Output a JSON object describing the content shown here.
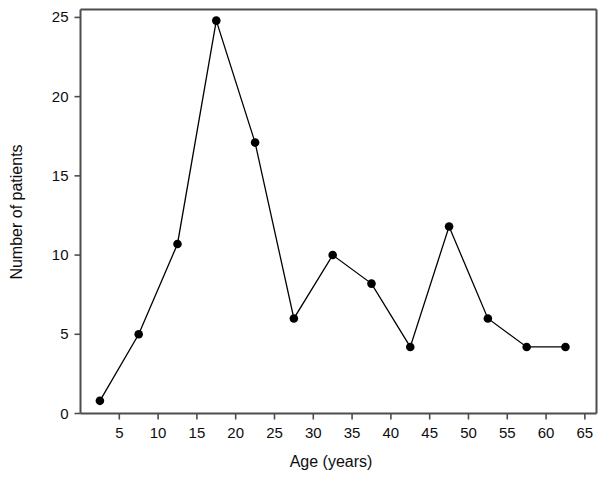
{
  "chart_data": {
    "type": "line",
    "title": "",
    "subtitle": "",
    "xlabel": "Age (years)",
    "ylabel": "Number of patients",
    "xlim": [
      0,
      66.5
    ],
    "ylim": [
      0,
      25.5
    ],
    "xticks": [
      5,
      10,
      15,
      20,
      25,
      30,
      35,
      40,
      45,
      50,
      55,
      60,
      65
    ],
    "yticks": [
      0,
      5,
      10,
      15,
      20,
      25
    ],
    "xtick_labels": [
      "5",
      "10",
      "15",
      "20",
      "25",
      "30",
      "35",
      "40",
      "45",
      "50",
      "55",
      "60",
      "65"
    ],
    "ytick_labels": [
      "0",
      "5",
      "10",
      "15",
      "20",
      "25"
    ],
    "grid": false,
    "legend": null,
    "legend_position": "none",
    "marker": "filled-circle",
    "marker_color": "#000000",
    "line_color": "#000000",
    "frame_color": "#4d4d4d",
    "background_color": "#ffffff",
    "x": [
      2.5,
      7.5,
      12.5,
      17.5,
      22.5,
      27.5,
      32.5,
      37.5,
      42.5,
      47.5,
      52.5,
      57.5,
      62.5
    ],
    "values": [
      0.8,
      5.0,
      10.7,
      24.8,
      17.1,
      6.0,
      10.0,
      8.2,
      4.2,
      11.8,
      6.0,
      4.2,
      4.2
    ],
    "points": [
      {
        "x": 2.5,
        "y": 0.8
      },
      {
        "x": 7.5,
        "y": 5.0
      },
      {
        "x": 12.5,
        "y": 10.7
      },
      {
        "x": 17.5,
        "y": 24.8
      },
      {
        "x": 22.5,
        "y": 17.1
      },
      {
        "x": 27.5,
        "y": 6.0
      },
      {
        "x": 32.5,
        "y": 10.0
      },
      {
        "x": 37.5,
        "y": 8.2
      },
      {
        "x": 42.5,
        "y": 4.2
      },
      {
        "x": 47.5,
        "y": 11.8
      },
      {
        "x": 52.5,
        "y": 6.0
      },
      {
        "x": 57.5,
        "y": 4.2
      },
      {
        "x": 62.5,
        "y": 4.2
      }
    ]
  }
}
